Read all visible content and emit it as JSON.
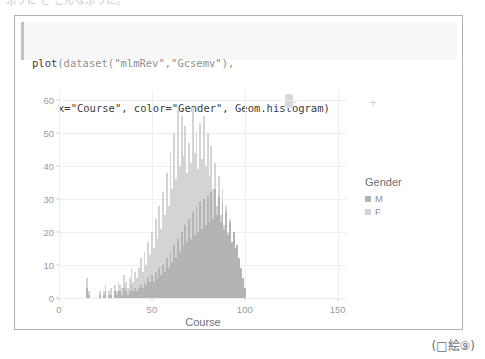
{
  "page": {
    "top_cut_text": "ふうに と こんなふうに。"
  },
  "code": {
    "line1_fn": "plot",
    "line1_rest": "(dataset(\"mlmRev\",\"Gcsemv\"),",
    "line2": "x=\"Course\", color=\"Gender\", Geom.histogram)",
    "full": "plot(dataset(\"mlmRev\",\"Gcsemv\"),\n    x=\"Course\", color=\"Gender\", Geom.histogram)"
  },
  "toolbar": {
    "zoom_out": "−",
    "zoom_in": "+",
    "handle_label": "slider-handle"
  },
  "legend": {
    "title": "Gender",
    "entries": [
      {
        "label": "M",
        "color": "#b4b4b4"
      },
      {
        "label": "F",
        "color": "#d4d4d4"
      }
    ]
  },
  "caption": "(□絵⑨)",
  "colors": {
    "series_m": "#b4b4b4",
    "series_f": "#d4d4d4",
    "grid": "#efeff1",
    "axis_text": "#9b9b9f",
    "panel_border": "#b2b2b6",
    "code_bg": "#f7f7f7"
  },
  "chart_data": {
    "type": "bar",
    "title": "",
    "xlabel": "Course",
    "ylabel": "",
    "xlim": [
      0,
      155
    ],
    "ylim": [
      0,
      63
    ],
    "xticks": [
      0,
      50,
      100,
      150
    ],
    "yticks": [
      0,
      10,
      20,
      30,
      40,
      50,
      60
    ],
    "grid": true,
    "legend_position": "right",
    "bin_width": 1,
    "stacking": "overlaid",
    "series": [
      {
        "name": "M",
        "color": "#b4b4b4",
        "x": [
          15,
          16,
          22,
          24,
          25,
          27,
          28,
          30,
          31,
          32,
          33,
          34,
          35,
          36,
          37,
          38,
          39,
          40,
          41,
          42,
          43,
          44,
          45,
          46,
          47,
          48,
          49,
          50,
          51,
          52,
          53,
          54,
          55,
          56,
          57,
          58,
          59,
          60,
          61,
          62,
          63,
          64,
          65,
          66,
          67,
          68,
          69,
          70,
          71,
          72,
          73,
          74,
          75,
          76,
          77,
          78,
          79,
          80,
          81,
          82,
          83,
          84,
          85,
          86,
          87,
          88,
          89,
          90,
          91,
          92,
          93,
          94,
          95,
          96,
          97,
          98,
          99,
          100
        ],
        "values": [
          3,
          1,
          1,
          1,
          2,
          1,
          1,
          2,
          1,
          2,
          2,
          1,
          3,
          2,
          1,
          2,
          4,
          2,
          3,
          2,
          3,
          4,
          3,
          5,
          4,
          6,
          5,
          7,
          5,
          8,
          6,
          9,
          7,
          10,
          8,
          12,
          9,
          14,
          11,
          16,
          12,
          18,
          14,
          20,
          16,
          22,
          17,
          24,
          18,
          26,
          19,
          28,
          20,
          29,
          21,
          30,
          22,
          31,
          23,
          32,
          24,
          33,
          25,
          31,
          23,
          29,
          21,
          26,
          19,
          23,
          17,
          20,
          15,
          16,
          12,
          9,
          6,
          3
        ]
      },
      {
        "name": "F",
        "color": "#d4d4d4",
        "x": [
          15,
          16,
          22,
          24,
          25,
          27,
          28,
          30,
          31,
          32,
          33,
          34,
          35,
          36,
          37,
          38,
          39,
          40,
          41,
          42,
          43,
          44,
          45,
          46,
          47,
          48,
          49,
          50,
          51,
          52,
          53,
          54,
          55,
          56,
          57,
          58,
          59,
          60,
          61,
          62,
          63,
          64,
          65,
          66,
          67,
          68,
          69,
          70,
          71,
          72,
          73,
          74,
          75,
          76,
          77,
          78,
          79,
          80,
          81,
          82,
          83,
          84,
          85,
          86,
          87,
          88,
          89,
          90,
          91,
          92,
          93,
          94,
          95,
          96,
          97,
          98,
          99,
          100
        ],
        "values": [
          6,
          2,
          2,
          2,
          4,
          2,
          3,
          4,
          2,
          5,
          4,
          3,
          7,
          5,
          3,
          6,
          9,
          5,
          8,
          6,
          9,
          12,
          8,
          14,
          10,
          17,
          13,
          20,
          15,
          24,
          18,
          28,
          21,
          32,
          25,
          38,
          28,
          44,
          33,
          50,
          36,
          57,
          40,
          55,
          43,
          52,
          38,
          47,
          41,
          58,
          44,
          50,
          39,
          53,
          42,
          55,
          40,
          50,
          37,
          46,
          33,
          41,
          28,
          37,
          25,
          33,
          22,
          28,
          20,
          24,
          17,
          20,
          14,
          16,
          11,
          8,
          5,
          3
        ]
      }
    ]
  }
}
